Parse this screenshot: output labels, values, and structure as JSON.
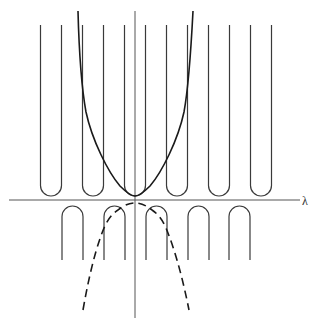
{
  "figure": {
    "axis_label_x": "λ",
    "colors": {
      "curve": "#1a1a1a",
      "wells": "#3a3a3a",
      "axes": "#555555"
    },
    "axes": {
      "horizontal": {
        "x1": 9,
        "x2": 300,
        "y": 200
      },
      "vertical": {
        "x": 135,
        "y1": 11,
        "y2": 318
      }
    },
    "upper_wells": {
      "centers_x": [
        51,
        93,
        135,
        177,
        219,
        261
      ],
      "half_width": 10.5,
      "top_y": 25,
      "bottom_y": 196
    },
    "lower_arches": {
      "centers_x": [
        72.5,
        114.5,
        156.5,
        198.5,
        239.5
      ],
      "half_width": 10.5,
      "top_y": 206,
      "bottom_y": 260
    },
    "solid_curve": {
      "style": "solid",
      "vertex": [
        135,
        196
      ],
      "points_left": [
        [
          78,
          11
        ],
        [
          82,
          90
        ],
        [
          100,
          157
        ],
        [
          135,
          196
        ]
      ]
    },
    "dashed_curve": {
      "style": "dashed",
      "vertex": [
        135,
        203
      ],
      "points_left": [
        [
          135,
          203
        ],
        [
          115,
          212
        ],
        [
          104,
          228
        ],
        [
          83,
          310
        ]
      ]
    }
  }
}
